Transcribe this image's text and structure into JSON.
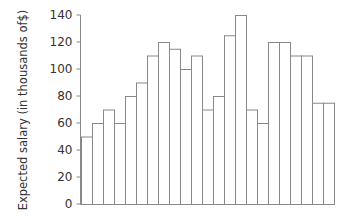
{
  "chart_data": {
    "type": "bar",
    "title": "",
    "xlabel": "",
    "ylabel": "Expected salary (in thousands of$)",
    "ylim": [
      0,
      140
    ],
    "yticks": [
      0,
      20,
      40,
      60,
      80,
      100,
      120,
      140
    ],
    "grid": false,
    "legend": null,
    "categories": [
      "1",
      "2",
      "3",
      "4",
      "5",
      "6",
      "7",
      "8",
      "9",
      "10",
      "11",
      "12",
      "13",
      "14",
      "15",
      "16",
      "17",
      "18",
      "19",
      "20",
      "21",
      "22",
      "23"
    ],
    "values": [
      50,
      60,
      70,
      60,
      80,
      90,
      110,
      120,
      115,
      100,
      110,
      70,
      80,
      125,
      140,
      70,
      60,
      120,
      120,
      110,
      110,
      75,
      75
    ],
    "bar_fill": "#ffffff",
    "bar_stroke": "#888888",
    "axis_color": "#888888"
  }
}
